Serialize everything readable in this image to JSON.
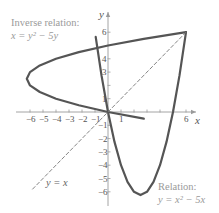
{
  "chart_data": {
    "type": "line",
    "title": "",
    "xlabel": "x",
    "ylabel": "y",
    "xlim": [
      -6.5,
      7
    ],
    "ylim": [
      -7,
      6.5
    ],
    "grid": false,
    "x_tick_labels": [
      "-6",
      "-5",
      "-4",
      "-3",
      "-2",
      "-1",
      "1",
      "6"
    ],
    "x_ticks": [
      -6,
      -5,
      -4,
      -3,
      -2,
      -1,
      1,
      2,
      3,
      4,
      5,
      6
    ],
    "y_tick_labels": [
      "6",
      "4",
      "3",
      "1",
      "-1",
      "-2",
      "-3",
      "-4",
      "-5",
      "-6"
    ],
    "y_ticks": [
      6,
      5,
      4,
      3,
      2,
      1,
      -1,
      -2,
      -3,
      -4,
      -5,
      -6
    ],
    "series": [
      {
        "name": "Relation: y = x^2 - 5x",
        "style": "solid",
        "color": "#555555",
        "equation": "y = x^2 - 5x",
        "x": [
          -0.95,
          -0.5,
          0,
          0.5,
          1,
          1.5,
          2,
          2.5,
          3,
          3.5,
          4,
          4.5,
          5,
          5.5,
          6
        ],
        "y": [
          5.65,
          2.75,
          0,
          -2.25,
          -4,
          -5.25,
          -6,
          -6.25,
          -6,
          -5.25,
          -4,
          -2.25,
          0,
          2.75,
          6
        ]
      },
      {
        "name": "Inverse relation: x = y^2 - 5y",
        "style": "solid",
        "color": "#555555",
        "equation": "x = y^2 - 5y",
        "x": [
          2.75,
          0,
          -2.25,
          -4,
          -5.25,
          -6,
          -6.25,
          -6,
          -5.25,
          -4,
          -2.25,
          0,
          2.75,
          6
        ],
        "y": [
          -0.5,
          0,
          0.5,
          1,
          1.5,
          2,
          2.5,
          3,
          3.5,
          4,
          4.5,
          5,
          5.5,
          6
        ]
      },
      {
        "name": "y = x",
        "style": "dashed",
        "color": "#777777",
        "equation": "y = x",
        "x": [
          -5.8,
          6
        ],
        "y": [
          -5.8,
          6
        ]
      }
    ],
    "annotations": [
      {
        "text_line1": "Inverse relation:",
        "text_line2": "x = y² − 5y",
        "position": "upper-left"
      },
      {
        "text_line1": "Relation:",
        "text_line2": "y = x² − 5x",
        "position": "lower-right"
      },
      {
        "text": "y = x",
        "position": "lower-left"
      }
    ]
  },
  "labels": {
    "x_axis": "x",
    "y_axis": "y",
    "inverse_line1": "Inverse relation:",
    "inverse_line2": "x = y² − 5y",
    "relation_line1": "Relation:",
    "relation_line2": "y = x² − 5x",
    "identity": "y = x"
  }
}
